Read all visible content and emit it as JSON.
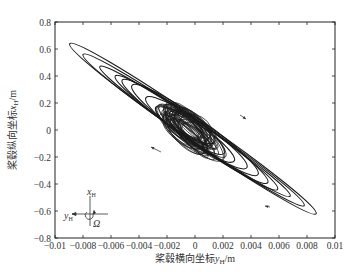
{
  "chart_data": {
    "type": "line",
    "title": "",
    "xlabel": "桨毂横向坐标y_H/m",
    "ylabel": "桨毂纵向坐标x_H/m",
    "xlim": [
      -0.01,
      0.01
    ],
    "ylim": [
      -0.8,
      0.8
    ],
    "xticks": [
      -0.01,
      -0.008,
      -0.006,
      -0.004,
      -0.002,
      0,
      0.002,
      0.004,
      0.006,
      0.008,
      0.01
    ],
    "xtick_labels": [
      "-0.01",
      "-0.008",
      "-0.006",
      "-0.004",
      "-0.002",
      "0",
      "0.002",
      "0.004",
      "0.006",
      "0.008",
      "0.01"
    ],
    "yticks": [
      0.8,
      0.6,
      0.4,
      0.2,
      0,
      -0.2,
      -0.4,
      -0.6,
      -0.8
    ],
    "ytick_labels": [
      "0.8",
      "0.6",
      "0.4",
      "0.2",
      "0",
      "-0.2",
      "-0.4",
      "-0.6",
      "-0.8"
    ],
    "grid": false,
    "legend": null,
    "series": [
      {
        "name": "hub trajectory (elliptical orbits, outermost to inner)",
        "ellipses": [
          {
            "cx": -0.00015,
            "cy": 0.01,
            "semi_major_x": 0.0088,
            "semi_major_y": 0.63,
            "semi_minor": 0.07
          },
          {
            "cx": -0.0001,
            "cy": 0.0,
            "semi_major_x": 0.0079,
            "semi_major_y": 0.56,
            "semi_minor": 0.065
          },
          {
            "cx": 0.0,
            "cy": -0.01,
            "semi_major_x": 0.0068,
            "semi_major_y": 0.48,
            "semi_minor": 0.06
          },
          {
            "cx": 0.0001,
            "cy": -0.02,
            "semi_major_x": 0.0058,
            "semi_major_y": 0.42,
            "semi_minor": 0.065
          },
          {
            "cx": 0.0,
            "cy": -0.01,
            "semi_major_x": 0.0052,
            "semi_major_y": 0.38,
            "semi_minor": 0.07
          },
          {
            "cx": 0.0,
            "cy": 0.0,
            "semi_major_x": 0.0045,
            "semi_major_y": 0.33,
            "semi_minor": 0.075
          },
          {
            "cx": 0.0001,
            "cy": -0.02,
            "semi_major_x": 0.0036,
            "semi_major_y": 0.26,
            "semi_minor": 0.07
          },
          {
            "cx": 0.0,
            "cy": -0.03,
            "semi_major_x": 0.0028,
            "semi_major_y": 0.2,
            "semi_minor": 0.065
          },
          {
            "cx": 0.0,
            "cy": -0.02,
            "semi_major_x": 0.0021,
            "semi_major_y": 0.15,
            "semi_minor": 0.06
          },
          {
            "cx": -0.0002,
            "cy": 0.02,
            "semi_major_x": 0.0016,
            "semi_major_y": 0.11,
            "semi_minor": 0.055
          }
        ],
        "extent": {
          "x_min": -0.0089,
          "x_max": 0.0086,
          "y_min": -0.63,
          "y_max": 0.64
        }
      }
    ],
    "annotations": [
      {
        "type": "arrow",
        "label": "direction arrow upper-right",
        "x": 0.0024,
        "y": 0.05,
        "direction": "down-right"
      },
      {
        "type": "arrow",
        "label": "direction arrow left",
        "x": -0.0045,
        "y": -0.17,
        "direction": "up-left"
      },
      {
        "type": "arrow",
        "label": "marker on outer orbit",
        "x": 0.0052,
        "y": -0.56,
        "direction": "left"
      },
      {
        "type": "inset",
        "label": "coordinate diagram",
        "axes": [
          "x_H",
          "y_H"
        ],
        "rotation_symbol": "Ω"
      }
    ]
  },
  "labels": {
    "xlabel_prefix": "桨毂横向坐标",
    "xlabel_var": "y",
    "xlabel_sub": "H",
    "xlabel_unit": "/m",
    "ylabel_prefix": "桨毂纵向坐标",
    "ylabel_var": "x",
    "ylabel_sub": "H",
    "ylabel_unit": "/m",
    "inset_x": "x",
    "inset_x_sub": "H",
    "inset_y": "y",
    "inset_y_sub": "H",
    "inset_omega": "Ω"
  }
}
